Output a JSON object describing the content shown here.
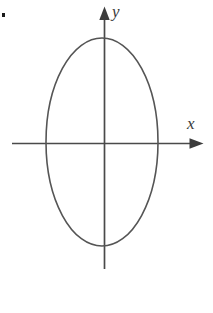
{
  "figure": {
    "kind": "coordinate-plane-with-ellipse",
    "background_color": "#ffffff",
    "stroke_color": "#555555",
    "label_color": "#3a3a3a",
    "marker_color": "#1a1a1a",
    "width": 213,
    "height": 313
  },
  "labels": {
    "x_axis": "x",
    "y_axis": "y",
    "item_marker": ""
  },
  "chart_data": {
    "type": "scatter",
    "title": "",
    "subtitle": "",
    "xlabel": "x",
    "ylabel": "y",
    "grid": false,
    "legend": [],
    "annotations": [],
    "axes": {
      "origin_px": [
        104,
        143
      ],
      "x_axis_px": {
        "x_start": 12,
        "x_end": 203,
        "y": 143,
        "arrow_end": "right"
      },
      "y_axis_px": {
        "y_start": 8,
        "y_end": 269,
        "x": 104,
        "arrow_end": "top"
      },
      "xlim": [
        -1.85,
        1.8
      ],
      "ylim": [
        -1.22,
        1.3
      ]
    },
    "shapes": [
      {
        "shape": "ellipse",
        "center_px": [
          102,
          142
        ],
        "semi_axis_x_px": 56,
        "semi_axis_y_px": 104,
        "center": [
          0,
          0
        ],
        "semi_axis_x": 1,
        "semi_axis_y": 1,
        "stroke": "#555555",
        "stroke_width_px": 1.6,
        "fill": "none",
        "orientation": "vertical-major-axis"
      }
    ],
    "points": [],
    "x": [],
    "values": []
  }
}
